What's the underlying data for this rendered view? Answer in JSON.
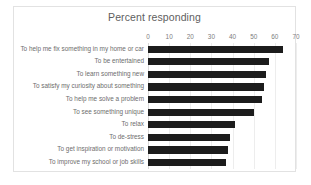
{
  "chart_data": {
    "type": "bar",
    "orientation": "horizontal",
    "title": "Percent responding",
    "xlabel": "",
    "ylabel": "",
    "xlim": [
      0,
      70
    ],
    "xticks": [
      0,
      10,
      20,
      30,
      40,
      50,
      60,
      70
    ],
    "grid": true,
    "legend": false,
    "bar_color": "#1c1c1c",
    "categories": [
      "To help me fix something in my home or car",
      "To be entertained",
      "To learn something new",
      "To satisfy my curiosity about something",
      "To help me solve a problem",
      "To see something unique",
      "To relax",
      "To de-stress",
      "To get inspiration or motivation",
      "To improve my school or job skills"
    ],
    "values": [
      64,
      57,
      56,
      55,
      54,
      50,
      41,
      39,
      38,
      37
    ]
  }
}
